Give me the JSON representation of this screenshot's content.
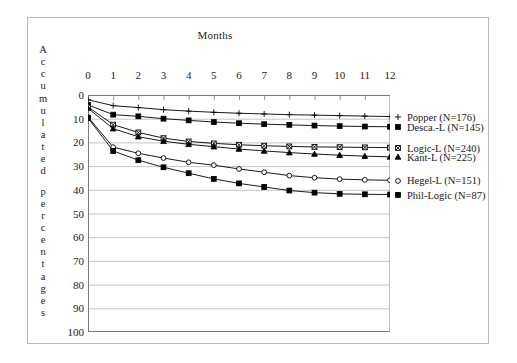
{
  "chart_data": {
    "type": "line",
    "title": "Months",
    "xlabel": "Months",
    "ylabel": "Accumulated percentages",
    "ylabel_letters": [
      "A",
      "c",
      "c",
      "u",
      "m",
      "u",
      "l",
      "a",
      "t",
      "e",
      "d",
      "",
      "p",
      "e",
      "r",
      "c",
      "e",
      "n",
      "t",
      "a",
      "g",
      "e",
      "s"
    ],
    "x": [
      0,
      1,
      2,
      3,
      4,
      5,
      6,
      7,
      8,
      9,
      10,
      11,
      12
    ],
    "xticks": [
      "0",
      "1",
      "2",
      "3",
      "4",
      "5",
      "6",
      "7",
      "8",
      "9",
      "10",
      "11",
      "12"
    ],
    "yticks": [
      "0",
      "10",
      "20",
      "30",
      "40",
      "50",
      "60",
      "70",
      "80",
      "90",
      "100"
    ],
    "xlim": [
      0,
      12
    ],
    "ylim": [
      0,
      100
    ],
    "y_inverted": true,
    "grid": true,
    "legend_position": "right",
    "series": [
      {
        "name": "Popper (N=176)",
        "label": "Popper (N=176)",
        "marker": "plus",
        "fill": "none",
        "color": "#000000",
        "values": [
          2.0,
          4.5,
          5.3,
          6.2,
          6.8,
          7.3,
          7.7,
          8.0,
          8.3,
          8.5,
          8.7,
          8.9,
          9.1
        ]
      },
      {
        "name": "Desca.-L (N=145)",
        "label": "Desca.-L (N=145)",
        "marker": "square",
        "fill": "solid",
        "color": "#000000",
        "values": [
          4.2,
          8.3,
          9.0,
          10.0,
          10.7,
          11.4,
          11.9,
          12.3,
          12.6,
          12.9,
          13.1,
          13.3,
          13.4
        ]
      },
      {
        "name": "Logic-L (N=240)",
        "label": "Logic-L (N=240)",
        "marker": "x-square",
        "fill": "none",
        "color": "#000000",
        "values": [
          5.0,
          12.5,
          15.8,
          18.2,
          19.6,
          20.4,
          21.0,
          21.4,
          21.7,
          21.9,
          22.0,
          22.1,
          22.2
        ]
      },
      {
        "name": "Kant-L (N=225)",
        "label": "Kant-L (N=225)",
        "marker": "triangle",
        "fill": "solid",
        "color": "#000000",
        "values": [
          5.6,
          14.2,
          17.6,
          19.5,
          20.8,
          21.8,
          22.8,
          23.6,
          24.3,
          24.9,
          25.4,
          25.8,
          26.1
        ]
      },
      {
        "name": "Hegel-L (N=151)",
        "label": "Hegel-L (N=151)",
        "marker": "circle",
        "fill": "none",
        "color": "#000000",
        "values": [
          9.3,
          22.0,
          24.6,
          26.6,
          28.4,
          29.6,
          31.2,
          32.6,
          34.0,
          34.9,
          35.5,
          35.8,
          36.0
        ]
      },
      {
        "name": "Phil-Logic (N=87)",
        "label": "Phil-Logic (N=87)",
        "marker": "square",
        "fill": "solid",
        "color": "#000000",
        "values": [
          9.7,
          23.6,
          27.5,
          30.5,
          33.0,
          35.4,
          37.3,
          38.8,
          40.3,
          41.2,
          41.7,
          41.9,
          42.0
        ]
      }
    ]
  }
}
